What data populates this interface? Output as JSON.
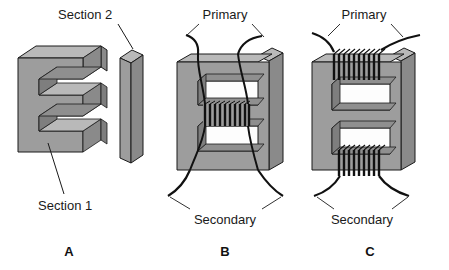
{
  "figure": {
    "background_color": "#ffffff",
    "width": 449,
    "height": 270,
    "colors": {
      "core_front_face": "#9d9d9d",
      "core_top_face": "#b9b9b9",
      "core_side_face": "#8a8a8a",
      "core_inner_shadow": "#7e7e7e",
      "window_opening": "#fdfdfd",
      "outline": "#1a1a1a",
      "wire": "#111111",
      "label_text": "#1a1a1a"
    }
  },
  "panels": [
    {
      "id": "panel-a",
      "letter": "A",
      "description": "Disassembled EI core showing the E lamination and the I lamination separated",
      "callouts": [
        {
          "name": "section-2",
          "text": "Section 2",
          "points_to": "i-bar"
        },
        {
          "name": "section-1",
          "text": "Section 1",
          "points_to": "e-core"
        }
      ],
      "parts": [
        {
          "name": "e-core",
          "shape": "E-lamination",
          "label": "Section 1"
        },
        {
          "name": "i-bar",
          "shape": "I-lamination",
          "label": "Section 2"
        }
      ],
      "coils": []
    },
    {
      "id": "panel-b",
      "letter": "B",
      "description": "Assembled EI core with both windings stacked on the center leg",
      "callouts": [
        {
          "name": "primary",
          "text": "Primary",
          "points_to": "top-leads"
        },
        {
          "name": "secondary",
          "text": "Secondary",
          "points_to": "bottom-leads"
        }
      ],
      "parts": [
        {
          "name": "e-core",
          "shape": "E-lamination"
        },
        {
          "name": "i-bar",
          "shape": "I-lamination"
        }
      ],
      "coils": [
        {
          "name": "center-leg-coil",
          "location": "center-leg",
          "turns": 10,
          "windings": "primary and secondary together"
        }
      ]
    },
    {
      "id": "panel-c",
      "letter": "C",
      "description": "Assembled EI core with the primary wound on the top arm and the secondary on the bottom arm",
      "callouts": [
        {
          "name": "primary",
          "text": "Primary",
          "points_to": "top-coil-leads"
        },
        {
          "name": "secondary",
          "text": "Secondary",
          "points_to": "bottom-coil-leads"
        }
      ],
      "parts": [
        {
          "name": "e-core",
          "shape": "E-lamination"
        },
        {
          "name": "i-bar",
          "shape": "I-lamination"
        }
      ],
      "coils": [
        {
          "name": "top-arm-coil",
          "location": "top-arm",
          "turns": 10,
          "windings": "primary"
        },
        {
          "name": "bottom-arm-coil",
          "location": "bottom-arm",
          "turns": 9,
          "windings": "secondary"
        }
      ]
    }
  ]
}
